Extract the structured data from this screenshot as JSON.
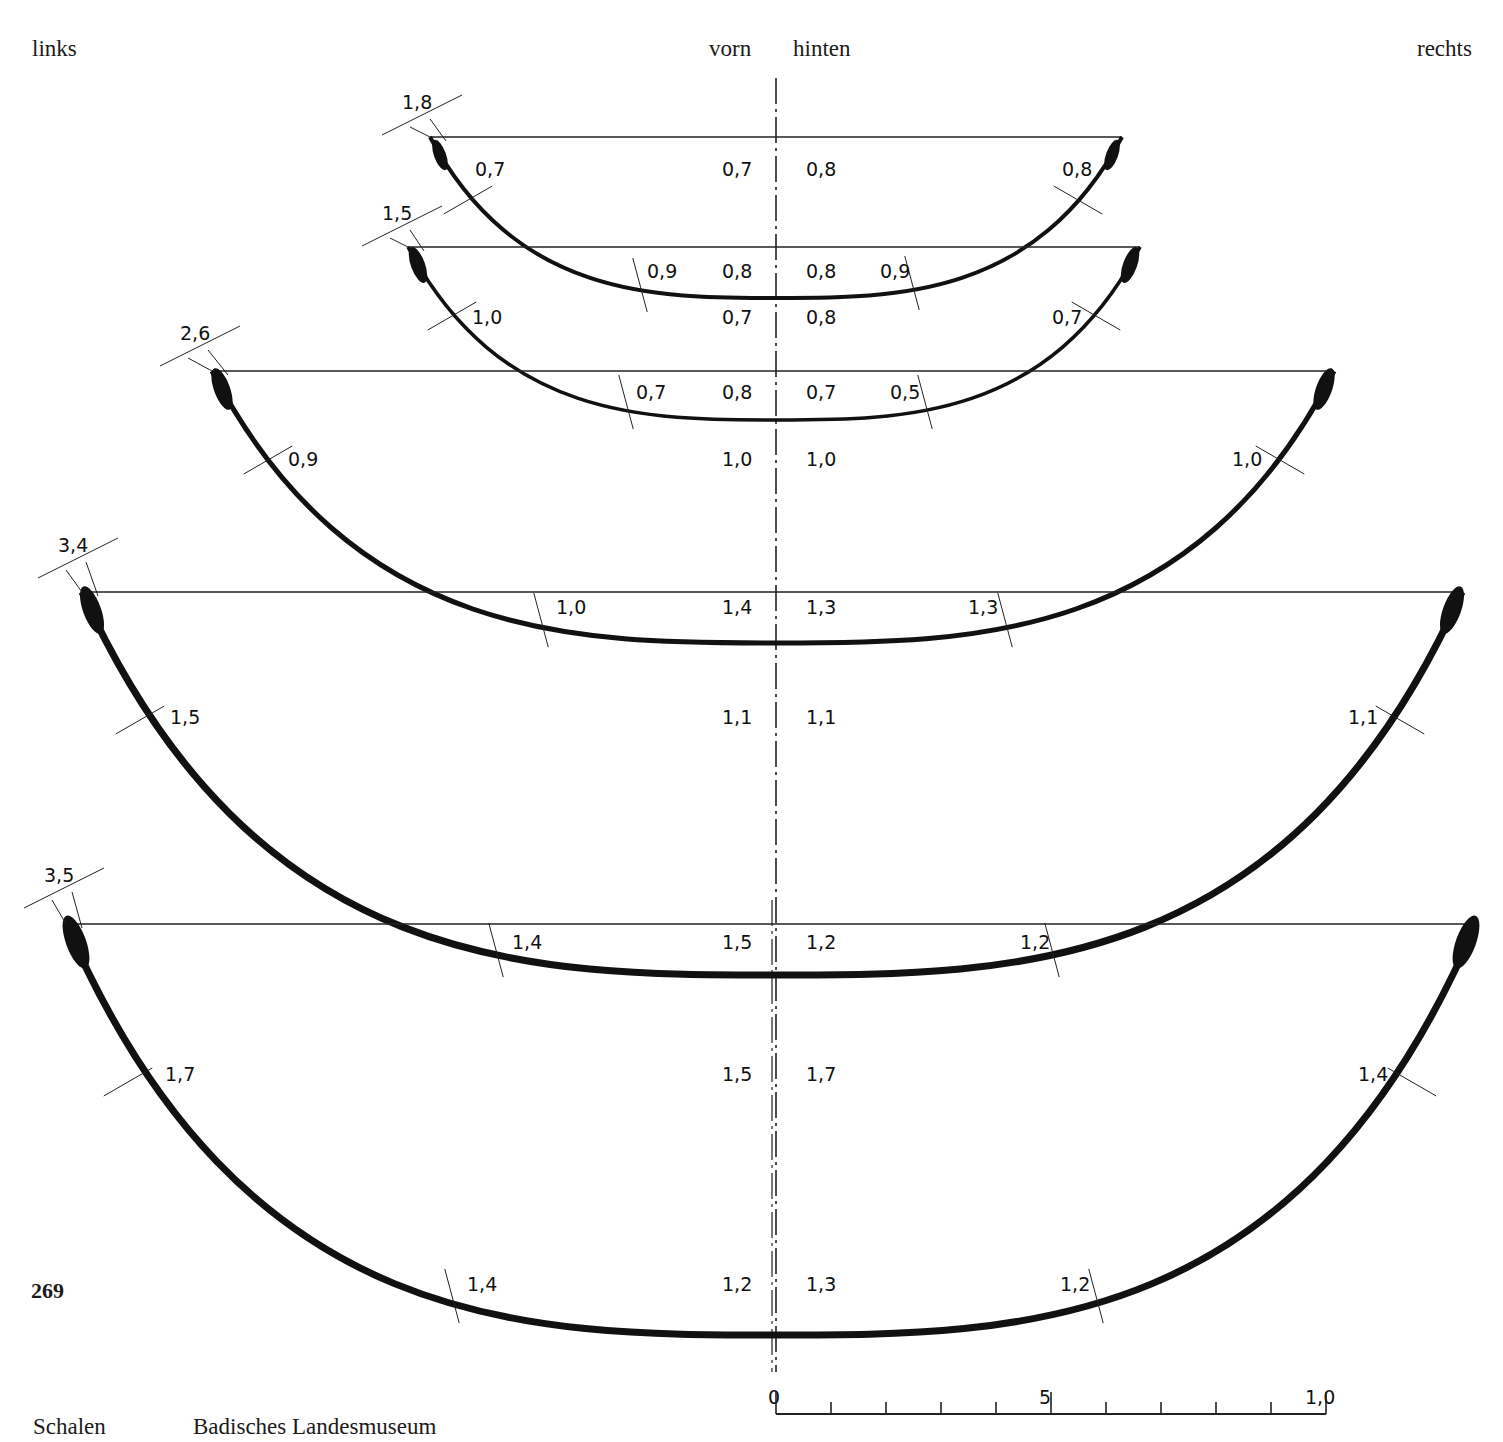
{
  "header": {
    "left": "links",
    "front": "vorn",
    "back": "hinten",
    "right": "rechts"
  },
  "plate_number": "269",
  "caption": {
    "category": "Schalen",
    "institution": "Badisches Landesmuseum"
  },
  "scale_bar": {
    "labels": [
      "0",
      "5",
      "1,0"
    ],
    "minor_ticks": 10
  },
  "profiles": [
    {
      "id": "bowl-1",
      "rim_thickness": "1,8",
      "left_wall": "0,7",
      "right_wall": "0,8",
      "center_upper_front": "0,7",
      "center_upper_back": "0,8",
      "left_lower": "0,9",
      "right_lower": "0,9",
      "center_base_front": "0,8",
      "center_base_back": "0,8"
    },
    {
      "id": "bowl-2",
      "rim_thickness": "1,5",
      "left_wall": "1,0",
      "right_wall": "0,7",
      "center_upper_front": "0,7",
      "center_upper_back": "0,8",
      "left_lower": "0,7",
      "right_lower": "0,5",
      "center_base_front": "0,8",
      "center_base_back": "0,7"
    },
    {
      "id": "bowl-3",
      "rim_thickness": "2,6",
      "left_wall": "0,9",
      "right_wall": "1,0",
      "center_upper_front": "1,0",
      "center_upper_back": "1,0",
      "left_lower": "1,0",
      "right_lower": "1,3",
      "center_base_front": "1,4",
      "center_base_back": "1,3"
    },
    {
      "id": "bowl-4",
      "rim_thickness": "3,4",
      "left_wall": "1,5",
      "right_wall": "1,1",
      "center_upper_front": "1,1",
      "center_upper_back": "1,1",
      "left_lower": "1,4",
      "right_lower": "1,2",
      "center_base_front": "1,5",
      "center_base_back": "1,2"
    },
    {
      "id": "bowl-5",
      "rim_thickness": "3,5",
      "left_wall": "1,7",
      "right_wall": "1,4",
      "center_upper_front": "1,5",
      "center_upper_back": "1,7",
      "left_lower": "1,4",
      "right_lower": "1,2",
      "center_base_front": "1,2",
      "center_base_back": "1,3"
    }
  ]
}
